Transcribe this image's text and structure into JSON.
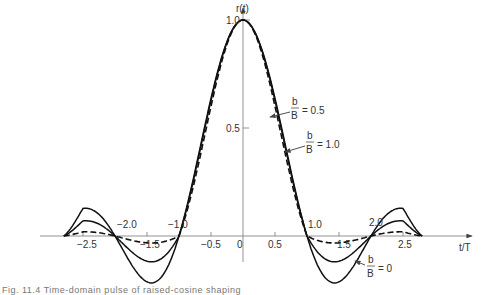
{
  "chart_data": {
    "type": "line",
    "title": "",
    "xlabel": "t/T",
    "ylabel": "r(t)",
    "xlim": [
      -2.8,
      2.8
    ],
    "ylim": [
      -0.2,
      1.0
    ],
    "grid": false,
    "x_ticks": [
      -2.5,
      -1.5,
      -0.5,
      0,
      0.5,
      1.5,
      2.5
    ],
    "x_tick_labels_above": [
      "-2.0",
      "-1.0",
      "1.0",
      "2.0"
    ],
    "y_ticks": [
      0.5,
      1.0
    ],
    "y_tick_labels": [
      "0.5",
      "1.0"
    ],
    "series": [
      {
        "name": "b/B = 0",
        "style": "solid",
        "b_ratio": 0.0,
        "x": [
          -2.8,
          -2.5,
          -2.0,
          -1.5,
          -1.0,
          -0.5,
          0,
          0.5,
          1.0,
          1.5,
          2.0,
          2.5,
          2.8
        ],
        "values": [
          0.0,
          0.13,
          0.0,
          -0.21,
          0.0,
          0.64,
          1.0,
          0.64,
          0.0,
          -0.21,
          0.0,
          0.13,
          0.0
        ]
      },
      {
        "name": "b/B = 0.5",
        "style": "solid",
        "b_ratio": 0.5,
        "x": [
          -2.8,
          -2.5,
          -2.0,
          -1.5,
          -1.0,
          -0.5,
          0,
          0.5,
          1.0,
          1.5,
          2.0,
          2.5,
          2.8
        ],
        "values": [
          0.0,
          0.07,
          0.0,
          -0.12,
          0.0,
          0.6,
          1.0,
          0.6,
          0.0,
          -0.12,
          0.0,
          0.07,
          0.0
        ]
      },
      {
        "name": "b/B = 1.0",
        "style": "dashed",
        "b_ratio": 1.0,
        "x": [
          -2.8,
          -2.5,
          -2.0,
          -1.5,
          -1.0,
          -0.5,
          0,
          0.5,
          1.0,
          1.5,
          2.0,
          2.5,
          2.8
        ],
        "values": [
          0.0,
          -0.02,
          0.0,
          -0.03,
          0.0,
          0.5,
          1.0,
          0.5,
          0.0,
          -0.03,
          0.0,
          -0.02,
          0.0
        ]
      }
    ],
    "annotations": [
      {
        "text_num": "b",
        "text_den": "B",
        "text_val": "= 0.5"
      },
      {
        "text_num": "b",
        "text_den": "B",
        "text_val": "= 1.0"
      },
      {
        "text_num": "b",
        "text_den": "B",
        "text_val": "= 0"
      }
    ]
  },
  "labels": {
    "ylabel": "r(t)",
    "xlabel": "t/T",
    "y1": "1.0",
    "y05": "0.5",
    "origin": "0",
    "xm25": "−2.5",
    "xm20": "−2.0",
    "xm15": "−1.5",
    "xm10": "−1.0",
    "xm05": "−0.5",
    "x05": "0.5",
    "x10": "1.0",
    "x15": "1.5",
    "x20": "2.0",
    "x25": "2.5",
    "ann05": "= 0.5",
    "ann10": "= 1.0",
    "ann0": "= 0",
    "b": "b",
    "B": "B"
  },
  "caption": "Fig. 11.4  Time-domain pulse of raised-cosine shaping"
}
